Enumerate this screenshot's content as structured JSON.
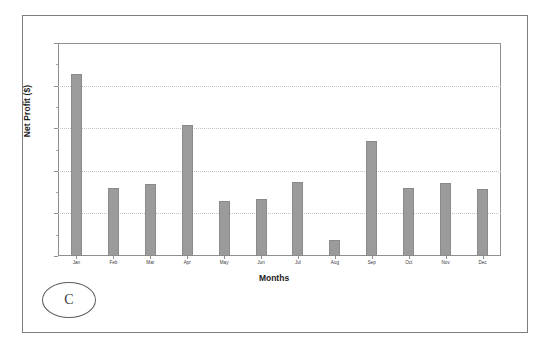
{
  "figure": {
    "panel_label": "C"
  },
  "chart_data": {
    "type": "bar",
    "title": "",
    "xlabel": "Months",
    "ylabel": "Net Profit ($)",
    "categories": [
      "Jan",
      "Feb",
      "Mar",
      "Apr",
      "May",
      "Jun",
      "Jul",
      "Aug",
      "Sep",
      "Oct",
      "Nov",
      "Dec"
    ],
    "values": [
      4270,
      1600,
      1690,
      3070,
      1285,
      1330,
      1730,
      375,
      2700,
      1590,
      1710,
      1565
    ],
    "series": [
      {
        "name": "Net Profit",
        "values": [
          4270,
          1600,
          1690,
          3070,
          1285,
          1330,
          1730,
          375,
          2700,
          1590,
          1710,
          1565
        ]
      }
    ],
    "ylim": [
      0,
      5000
    ],
    "yticks": [
      0,
      1000,
      2000,
      3000,
      4000,
      5000
    ],
    "ytick_labels": [
      "0",
      "1000",
      "2000",
      "3000",
      "4000",
      "5000"
    ],
    "grid": true,
    "grid_axis": "y",
    "legend": false,
    "legend_position": "none",
    "bar_color": "#9b9b9b",
    "bar_edge_color": "#8a8a8a",
    "grid_color": "#c4c4c4",
    "axis_color": "#8f8f8f",
    "text_color": "#3a3a3a"
  }
}
